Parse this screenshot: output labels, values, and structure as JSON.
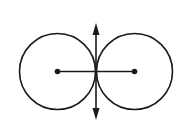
{
  "diagram": {
    "stroke_color": "#1a1a1a",
    "background": "#ffffff",
    "circles": [
      {
        "name": "left-circle",
        "cx": 57.5,
        "cy": 71.5,
        "r": 38
      },
      {
        "name": "right-circle",
        "cx": 134.5,
        "cy": 71.5,
        "r": 38
      }
    ],
    "center_line": {
      "x1": 57.5,
      "y1": 71.5,
      "x2": 134.5,
      "y2": 71.5
    },
    "axis_arrow": {
      "x": 96,
      "y_top": 23,
      "y_bottom": 120
    }
  }
}
